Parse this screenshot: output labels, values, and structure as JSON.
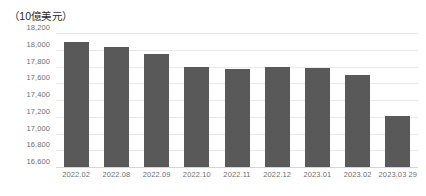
{
  "chart_data": {
    "type": "bar",
    "title": "（10億美元）",
    "xlabel": "",
    "ylabel": "",
    "unit_caption": "（10億美元）",
    "categories": [
      "2022.02",
      "2022.08",
      "2022.09",
      "2022.10",
      "2022.11",
      "2022.12",
      "2023.01",
      "2023.02",
      "2023.03 29"
    ],
    "values": [
      18090,
      18030,
      17950,
      17790,
      17770,
      17790,
      17780,
      17700,
      17210
    ],
    "ylim": [
      16600,
      18200
    ],
    "ytick_values": [
      16600,
      16800,
      17000,
      17200,
      17400,
      17600,
      17800,
      18000,
      18200
    ],
    "ytick_labels": [
      "16,600",
      "16,800",
      "17,000",
      "17,200",
      "17,400",
      "17,600",
      "17,800",
      "18,000",
      "18,200"
    ],
    "grid": true,
    "legend": null,
    "legend_position": "none",
    "colors": {
      "bar": "#595959",
      "gridline": "#e9e9e9",
      "baseline": "#d6d6d6",
      "tick_text": "#6f6f6f",
      "caption_text": "#2b2b2b",
      "background": "#ffffff"
    }
  }
}
